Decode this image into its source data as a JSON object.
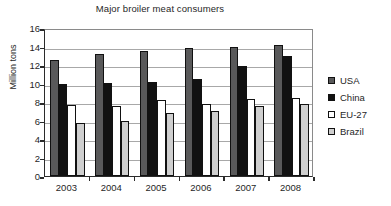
{
  "chart_data": {
    "type": "bar",
    "title": "Major broiler meat consumers",
    "xlabel": "",
    "ylabel": "Million tons",
    "categories": [
      "2003",
      "2004",
      "2005",
      "2006",
      "2007",
      "2008"
    ],
    "series": [
      {
        "name": "USA",
        "color": "#59595a",
        "values": [
          12.5,
          13.2,
          13.5,
          13.8,
          13.9,
          14.2
        ]
      },
      {
        "name": "China",
        "color": "#111111",
        "values": [
          10.0,
          10.1,
          10.2,
          10.5,
          11.9,
          13.0
        ]
      },
      {
        "name": "EU-27",
        "color": "#ffffff",
        "values": [
          7.7,
          7.6,
          8.2,
          7.8,
          8.3,
          8.4
        ]
      },
      {
        "name": "Brazil",
        "color": "#cfcfcf",
        "values": [
          5.7,
          6.0,
          6.8,
          7.0,
          7.6,
          7.8
        ]
      }
    ],
    "ylim": [
      0,
      16
    ],
    "yticks": [
      "0",
      "2",
      "4",
      "6",
      "8",
      "10",
      "12",
      "14",
      "16"
    ],
    "grid": true,
    "legend_position": "right"
  }
}
